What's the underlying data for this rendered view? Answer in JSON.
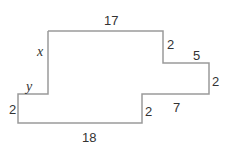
{
  "figure": {
    "type": "rectilinear-polygon",
    "stroke_color": "#9a9a9a",
    "labels": {
      "top": "17",
      "right_upper": "2",
      "right_step": "5",
      "right_lower": "2",
      "bottom_step": "7",
      "inner_vertical": "2",
      "bottom": "18",
      "left": "2",
      "left_step": "y",
      "left_upper": "x"
    }
  }
}
